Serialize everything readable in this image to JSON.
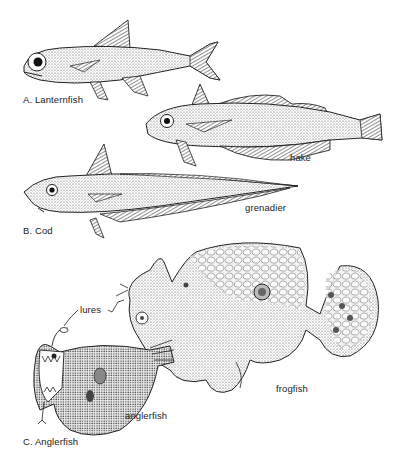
{
  "figure": {
    "type": "scientific-illustration",
    "colors": {
      "ink": "#222222",
      "background": "#ffffff",
      "stipple": "#555555"
    }
  },
  "groups": [
    {
      "id": "A",
      "label": "A. Lanternfish",
      "species": []
    },
    {
      "id": "B",
      "label": "B. Cod",
      "species": [
        {
          "name": "hake"
        },
        {
          "name": "grenadier"
        }
      ]
    },
    {
      "id": "C",
      "label": "C. Anglerfish",
      "species": [
        {
          "name": "anglerfish"
        },
        {
          "name": "frogfish"
        }
      ]
    }
  ],
  "annotations": {
    "lures": "lures"
  },
  "labels": {
    "lanternfish": "A. Lanternfish",
    "hake": "hake",
    "grenadier": "grenadier",
    "cod": "B. Cod",
    "lures": "lures",
    "anglerfish": "anglerfish",
    "frogfish": "frogfish",
    "anglerfish_group": "C. Anglerfish"
  }
}
